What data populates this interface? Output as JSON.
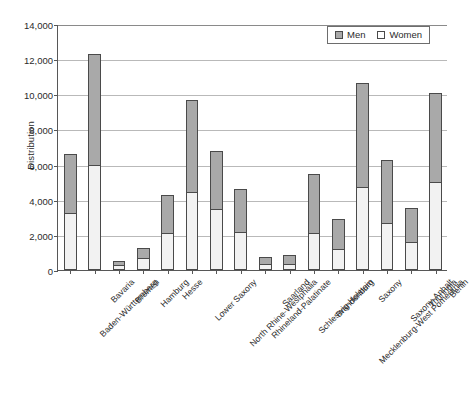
{
  "chart_data": {
    "type": "bar",
    "title": "",
    "xlabel": "",
    "ylabel": "Distribution",
    "ylim": [
      0,
      14000
    ],
    "ytick_values": [
      0,
      2000,
      4000,
      6000,
      8000,
      10000,
      12000,
      14000
    ],
    "ytick_labels": [
      "0",
      "2,000",
      "4,000",
      "6,000",
      "8,000",
      "10,000",
      "12,000",
      "14,000"
    ],
    "grid": true,
    "stacked": true,
    "legend_position": "top-right",
    "categories": [
      "Baden-Württemberg",
      "Bavaria",
      "Bremen",
      "Hamburg",
      "Hesse",
      "Lower Saxony",
      "North Rhine-Westphalia",
      "Rhineland-Palatinate",
      "Saarland",
      "Schleswig-Holstein",
      "Brandenburg",
      "Mecklenburg-West Pomerania",
      "Saxony",
      "Saxony-Anhalt",
      "Thuringia",
      "Berlin"
    ],
    "series": [
      {
        "name": "Women",
        "color": "#f2f2f2",
        "values": [
          3250,
          6000,
          290,
          680,
          2100,
          4450,
          3450,
          2150,
          340,
          370,
          2100,
          1200,
          4700,
          2700,
          1600,
          5000
        ]
      },
      {
        "name": "Men",
        "color": "#a9a9a9",
        "values": [
          3350,
          6300,
          230,
          570,
          2150,
          5250,
          3300,
          2450,
          390,
          510,
          3350,
          1700,
          5950,
          3550,
          1950,
          5100
        ]
      }
    ],
    "totals": [
      6600,
      12300,
      520,
      1250,
      4250,
      9700,
      6750,
      4600,
      730,
      880,
      5450,
      2900,
      10650,
      6250,
      3550,
      10100
    ]
  },
  "legend": {
    "items": [
      {
        "label": "Men",
        "swatch": "men-swatch"
      },
      {
        "label": "Women",
        "swatch": "women-swatch"
      }
    ]
  },
  "caption": {
    "text": ""
  }
}
